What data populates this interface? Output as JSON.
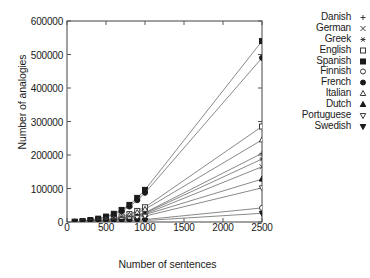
{
  "chart_data": {
    "type": "line",
    "title": "",
    "xlabel": "Number of sentences",
    "ylabel": "Number of analogies",
    "xlim": [
      0,
      2500
    ],
    "ylim": [
      0,
      600000
    ],
    "xticks": [
      0,
      500,
      1000,
      1500,
      2000,
      2500
    ],
    "xtick_labels": [
      "0",
      "500",
      "1000",
      "1500",
      "2000",
      "2500"
    ],
    "yticks": [
      0,
      100000,
      200000,
      300000,
      400000,
      500000,
      600000
    ],
    "ytick_labels": [
      "0",
      "100000",
      "200000",
      "300000",
      "400000",
      "500000",
      "600000"
    ],
    "grid": false,
    "legend_position": "right-outside",
    "series": [
      {
        "name": "Danish",
        "marker": "plus",
        "color": "#3a3a3a",
        "x": [
          100,
          200,
          300,
          400,
          500,
          600,
          700,
          800,
          900,
          1000,
          2500
        ],
        "y": [
          300,
          900,
          1800,
          3000,
          4800,
          7200,
          10500,
          15000,
          21000,
          28000,
          205000
        ]
      },
      {
        "name": "German",
        "marker": "cross",
        "color": "#3a3a3a",
        "x": [
          100,
          200,
          300,
          400,
          500,
          600,
          700,
          800,
          900,
          1000,
          2500
        ],
        "y": [
          200,
          700,
          1500,
          2600,
          4200,
          6300,
          9200,
          13000,
          18000,
          24000,
          165000
        ]
      },
      {
        "name": "Greek",
        "marker": "asterisk",
        "color": "#3a3a3a",
        "x": [
          100,
          200,
          300,
          400,
          500,
          600,
          700,
          800,
          900,
          1000,
          2500
        ],
        "y": [
          250,
          800,
          1700,
          2900,
          4600,
          6900,
          10000,
          14200,
          19800,
          26500,
          188000
        ]
      },
      {
        "name": "English",
        "marker": "square-open",
        "color": "#3a3a3a",
        "x": [
          100,
          200,
          300,
          400,
          500,
          600,
          700,
          800,
          900,
          1000,
          2500
        ],
        "y": [
          400,
          1300,
          2700,
          4600,
          7400,
          11200,
          16500,
          23500,
          33000,
          44000,
          285000
        ]
      },
      {
        "name": "Spanish",
        "marker": "square-filled",
        "color": "#1a1a1a",
        "x": [
          100,
          200,
          300,
          400,
          500,
          600,
          700,
          800,
          900,
          1000,
          2500
        ],
        "y": [
          800,
          2700,
          5800,
          10000,
          16200,
          24500,
          36000,
          51000,
          72000,
          96000,
          540000
        ]
      },
      {
        "name": "Finnish",
        "marker": "circle-open",
        "color": "#3a3a3a",
        "x": [
          100,
          200,
          300,
          400,
          500,
          600,
          700,
          800,
          900,
          1000,
          2500
        ],
        "y": [
          60,
          200,
          430,
          760,
          1200,
          1850,
          2700,
          3900,
          5400,
          7200,
          42000
        ]
      },
      {
        "name": "French",
        "marker": "circle-filled",
        "color": "#1a1a1a",
        "x": [
          100,
          200,
          300,
          400,
          500,
          600,
          700,
          800,
          900,
          1000,
          2500
        ],
        "y": [
          700,
          2400,
          5200,
          9000,
          14600,
          22000,
          32500,
          46000,
          65000,
          87000,
          490000
        ]
      },
      {
        "name": "Italian",
        "marker": "triangle-up-open",
        "color": "#3a3a3a",
        "x": [
          100,
          200,
          300,
          400,
          500,
          600,
          700,
          800,
          900,
          1000,
          2500
        ],
        "y": [
          340,
          1100,
          2300,
          4000,
          6400,
          9700,
          14200,
          20200,
          28300,
          37800,
          245000
        ]
      },
      {
        "name": "Dutch",
        "marker": "triangle-up-filled",
        "color": "#1a1a1a",
        "x": [
          100,
          200,
          300,
          400,
          500,
          600,
          700,
          800,
          900,
          1000,
          2500
        ],
        "y": [
          190,
          620,
          1320,
          2300,
          3700,
          5600,
          8200,
          11700,
          16400,
          22000,
          128000
        ]
      },
      {
        "name": "Portuguese",
        "marker": "triangle-down-open",
        "color": "#3a3a3a",
        "x": [
          100,
          200,
          300,
          400,
          500,
          600,
          700,
          800,
          900,
          1000,
          2500
        ],
        "y": [
          150,
          500,
          1060,
          1840,
          2950,
          4480,
          6550,
          9350,
          13100,
          17500,
          102000
        ]
      },
      {
        "name": "Swedish",
        "marker": "triangle-down-filled",
        "color": "#1a1a1a",
        "x": [
          100,
          200,
          300,
          400,
          500,
          600,
          700,
          800,
          900,
          1000,
          2500
        ],
        "y": [
          40,
          120,
          260,
          450,
          720,
          1100,
          1620,
          2320,
          3250,
          4350,
          26000
        ]
      }
    ]
  },
  "axis_labels": {
    "x": "Number of sentences",
    "y": "Number of analogies"
  }
}
